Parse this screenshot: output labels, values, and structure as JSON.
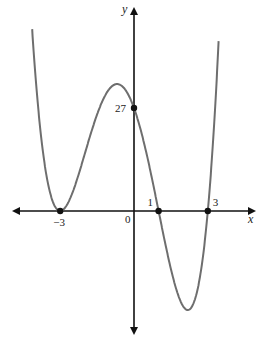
{
  "chart_data": {
    "type": "line",
    "title": "",
    "function": "f(x) = (x+3)^2 (x-1)(x-3)",
    "xlabel": "x",
    "ylabel": "y",
    "xlim": [
      -5.0,
      5.0
    ],
    "ylim": [
      -32,
      53
    ],
    "grid": false,
    "legend": null,
    "marked_points": [
      {
        "x": -3,
        "y": 0,
        "label": "−3"
      },
      {
        "x": 1,
        "y": 0,
        "label": "1"
      },
      {
        "x": 3,
        "y": 0,
        "label": "3"
      },
      {
        "x": 0,
        "y": 27,
        "label": "27"
      }
    ],
    "origin_label": "0",
    "series": [
      {
        "name": "f(x)",
        "color": "#6e6e6e"
      }
    ]
  },
  "colors": {
    "curve": "#6e6e6e",
    "axis": "#111111"
  }
}
